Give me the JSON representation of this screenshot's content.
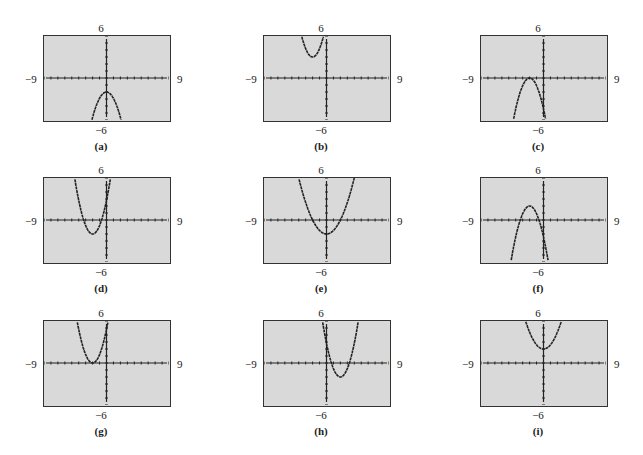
{
  "window": {
    "xmin": -9,
    "xmax": 9,
    "ymin": -6,
    "ymax": 6,
    "xscl": 1,
    "yscl": 1
  },
  "axis_labels": {
    "top": "6",
    "bottom": "−6",
    "left": "−9",
    "right": "9"
  },
  "colors": {
    "screen": "#d9d9d9",
    "border": "#333333",
    "curve": "#222222"
  },
  "chart_data": [
    {
      "type": "line",
      "caption": "(a)",
      "shape": "parabola opening down",
      "vertex_approx": [
        0,
        -2
      ],
      "a_sign": -1,
      "xlim": [
        -9,
        9
      ],
      "ylim": [
        -6,
        6
      ]
    },
    {
      "type": "line",
      "caption": "(b)",
      "shape": "parabola opening up",
      "vertex_approx": [
        -2,
        3
      ],
      "a_sign": 1,
      "xlim": [
        -9,
        9
      ],
      "ylim": [
        -6,
        6
      ]
    },
    {
      "type": "line",
      "caption": "(c)",
      "shape": "parabola opening down",
      "vertex_approx": [
        -2,
        0
      ],
      "a_sign": -1,
      "xlim": [
        -9,
        9
      ],
      "ylim": [
        -6,
        6
      ]
    },
    {
      "type": "line",
      "caption": "(d)",
      "shape": "parabola opening up",
      "vertex_approx": [
        -2,
        -2
      ],
      "a_sign": 1,
      "xlim": [
        -9,
        9
      ],
      "ylim": [
        -6,
        6
      ]
    },
    {
      "type": "line",
      "caption": "(e)",
      "shape": "parabola opening up",
      "vertex_approx": [
        0,
        -2
      ],
      "a_sign": 1,
      "xlim": [
        -9,
        9
      ],
      "ylim": [
        -6,
        6
      ]
    },
    {
      "type": "line",
      "caption": "(f)",
      "shape": "parabola opening down",
      "vertex_approx": [
        -2,
        2
      ],
      "a_sign": -1,
      "xlim": [
        -9,
        9
      ],
      "ylim": [
        -6,
        6
      ]
    },
    {
      "type": "line",
      "caption": "(g)",
      "shape": "parabola opening up",
      "vertex_approx": [
        -2,
        0
      ],
      "a_sign": 1,
      "xlim": [
        -9,
        9
      ],
      "ylim": [
        -6,
        6
      ]
    },
    {
      "type": "line",
      "caption": "(h)",
      "shape": "parabola opening up",
      "vertex_approx": [
        2,
        -2
      ],
      "a_sign": 1,
      "xlim": [
        -9,
        9
      ],
      "ylim": [
        -6,
        6
      ]
    },
    {
      "type": "line",
      "caption": "(i)",
      "shape": "parabola opening up",
      "vertex_approx": [
        0,
        2
      ],
      "a_sign": 1,
      "xlim": [
        -9,
        9
      ],
      "ylim": [
        -6,
        6
      ]
    }
  ],
  "panels": [
    {
      "caption": "(a)",
      "x": 30,
      "y": 25
    },
    {
      "caption": "(b)",
      "x": 250,
      "y": 25
    },
    {
      "caption": "(c)",
      "x": 467,
      "y": 25
    },
    {
      "caption": "(d)",
      "x": 30,
      "y": 167
    },
    {
      "caption": "(e)",
      "x": 250,
      "y": 167
    },
    {
      "caption": "(f)",
      "x": 467,
      "y": 167
    },
    {
      "caption": "(g)",
      "x": 30,
      "y": 310
    },
    {
      "caption": "(h)",
      "x": 250,
      "y": 310
    },
    {
      "caption": "(i)",
      "x": 467,
      "y": 310
    }
  ]
}
